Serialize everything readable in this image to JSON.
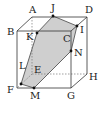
{
  "diagram": {
    "colors": {
      "edge": "#333333",
      "hidden_edge": "#777777",
      "section_fill": "#cfcfcf",
      "point": "#111111"
    },
    "vertices": [
      {
        "name": "A",
        "label": "A"
      },
      {
        "name": "B",
        "label": "B"
      },
      {
        "name": "C",
        "label": "C"
      },
      {
        "name": "D",
        "label": "D"
      },
      {
        "name": "E",
        "label": "E"
      },
      {
        "name": "F",
        "label": "F"
      },
      {
        "name": "G",
        "label": "G"
      },
      {
        "name": "H",
        "label": "H"
      }
    ],
    "points": [
      {
        "name": "J",
        "label": "J"
      },
      {
        "name": "I",
        "label": "I"
      },
      {
        "name": "K",
        "label": "K"
      },
      {
        "name": "N",
        "label": "N"
      },
      {
        "name": "M",
        "label": "M"
      },
      {
        "name": "L",
        "label": "L"
      }
    ],
    "section_polygon": [
      "J",
      "I",
      "N",
      "M",
      "F",
      "K"
    ]
  }
}
